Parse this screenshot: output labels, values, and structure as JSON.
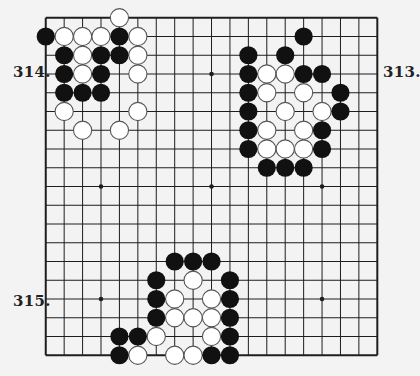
{
  "board": {
    "size": 19,
    "origin_x": 45.75,
    "origin_y": 17.75,
    "step_x": 18.42,
    "step_y": 18.75,
    "line_color": "#1e1e1e",
    "background": "#f3f3f3",
    "black_stone_color": "#111111",
    "white_stone_color": "#ffffff",
    "white_stone_stroke": "#555555",
    "star_points": [
      [
        4,
        4
      ],
      [
        10,
        4
      ],
      [
        16,
        4
      ],
      [
        4,
        10
      ],
      [
        10,
        10
      ],
      [
        16,
        10
      ],
      [
        4,
        16
      ],
      [
        10,
        16
      ],
      [
        16,
        16
      ]
    ]
  },
  "problems": [
    {
      "label": "314.",
      "position": "top-left"
    },
    {
      "label": "313.",
      "position": "top-right"
    },
    {
      "label": "315.",
      "position": "bottom-left"
    }
  ],
  "stones": {
    "black": [
      [
        1,
        2
      ],
      [
        5,
        2
      ],
      [
        2,
        3
      ],
      [
        4,
        3
      ],
      [
        5,
        3
      ],
      [
        2,
        4
      ],
      [
        4,
        4
      ],
      [
        2,
        5
      ],
      [
        3,
        5
      ],
      [
        4,
        5
      ],
      [
        15,
        2
      ],
      [
        12,
        3
      ],
      [
        14,
        3
      ],
      [
        12,
        4
      ],
      [
        15,
        4
      ],
      [
        16,
        4
      ],
      [
        12,
        5
      ],
      [
        17,
        5
      ],
      [
        12,
        6
      ],
      [
        17,
        6
      ],
      [
        12,
        7
      ],
      [
        16,
        7
      ],
      [
        12,
        8
      ],
      [
        16,
        8
      ],
      [
        13,
        9
      ],
      [
        14,
        9
      ],
      [
        15,
        9
      ],
      [
        8,
        14
      ],
      [
        9,
        14
      ],
      [
        10,
        14
      ],
      [
        7,
        15
      ],
      [
        11,
        15
      ],
      [
        7,
        16
      ],
      [
        11,
        16
      ],
      [
        7,
        17
      ],
      [
        11,
        17
      ],
      [
        5,
        18
      ],
      [
        6,
        18
      ],
      [
        11,
        18
      ],
      [
        5,
        19
      ],
      [
        10,
        19
      ],
      [
        11,
        19
      ]
    ],
    "white": [
      [
        5,
        1
      ],
      [
        2,
        2
      ],
      [
        3,
        2
      ],
      [
        4,
        2
      ],
      [
        6,
        2
      ],
      [
        3,
        3
      ],
      [
        6,
        3
      ],
      [
        3,
        4
      ],
      [
        6,
        4
      ],
      [
        2,
        6
      ],
      [
        6,
        6
      ],
      [
        3,
        7
      ],
      [
        5,
        7
      ],
      [
        13,
        4
      ],
      [
        14,
        4
      ],
      [
        13,
        5
      ],
      [
        15,
        5
      ],
      [
        14,
        6
      ],
      [
        16,
        6
      ],
      [
        13,
        7
      ],
      [
        15,
        7
      ],
      [
        13,
        8
      ],
      [
        14,
        8
      ],
      [
        15,
        8
      ],
      [
        9,
        15
      ],
      [
        8,
        16
      ],
      [
        10,
        16
      ],
      [
        8,
        17
      ],
      [
        9,
        17
      ],
      [
        10,
        17
      ],
      [
        7,
        18
      ],
      [
        10,
        18
      ],
      [
        6,
        19
      ],
      [
        8,
        19
      ],
      [
        9,
        19
      ]
    ]
  }
}
